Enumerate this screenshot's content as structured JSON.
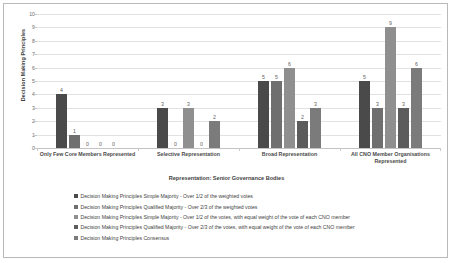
{
  "chart_data": {
    "type": "bar",
    "title": "",
    "xlabel": "Representation: Senior Governance Bodies",
    "ylabel": "Decision Making Principles",
    "ylim": [
      0,
      10
    ],
    "yticks": [
      0,
      1,
      2,
      3,
      4,
      5,
      6,
      7,
      8,
      9,
      10
    ],
    "grid": true,
    "legend_position": "bottom",
    "categories": [
      "Only Few Core Members Represented",
      "Selective Representation",
      "Broad Representation",
      "All CNO Member Organisations Represented"
    ],
    "series": [
      {
        "name": "Decision Making Principles Simple Majority - Over 1/2 of the weighted votes",
        "color": "#4a4a4a",
        "values": [
          4,
          3,
          5,
          5
        ]
      },
      {
        "name": "Decision Making Principles Qualified Majority - Over 2/3 of the weighted votes",
        "color": "#6f6f6f",
        "values": [
          1,
          0,
          5,
          3
        ]
      },
      {
        "name": "Decision Making Principles Simple Majority - Over 1/2 of the votes, with equal weight of the vote of each CNO member",
        "color": "#8f8f8f",
        "values": [
          0,
          3,
          6,
          9
        ]
      },
      {
        "name": "Decision Making Principles Qualified Majority - Over 2/3 of the votes, with equal weight of the vote of each CNO member",
        "color": "#5c5c5c",
        "values": [
          0,
          0,
          2,
          3
        ]
      },
      {
        "name": "Decision Making Principles Consensus",
        "color": "#7b7b7b",
        "values": [
          0,
          2,
          3,
          6
        ]
      }
    ]
  }
}
